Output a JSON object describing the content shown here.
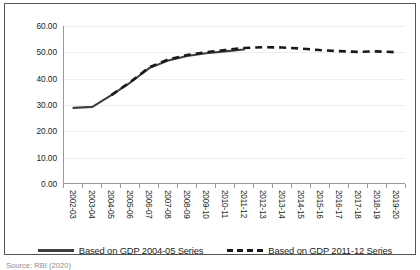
{
  "chart_data": {
    "type": "line",
    "title": "",
    "xlabel": "",
    "ylabel": "",
    "ylim": [
      0,
      60
    ],
    "ytick_step": 10,
    "ytick_labels": [
      "0.00",
      "10.00",
      "20.00",
      "30.00",
      "40.00",
      "50.00",
      "60.00"
    ],
    "ytick_values": [
      0,
      10,
      20,
      30,
      40,
      50,
      60
    ],
    "grid": true,
    "grid_axis": "y",
    "legend_position": "bottom",
    "categories": [
      "2002-03",
      "2003-04",
      "2004-05",
      "2005-06",
      "2006-07",
      "2007-08",
      "2008-09",
      "2009-10",
      "2010-11",
      "2011-12",
      "2012-13",
      "2013-14",
      "2014-15",
      "2015-16",
      "2016-17",
      "2017-18",
      "2018-19",
      "2019-20"
    ],
    "series": [
      {
        "name": "Based on GDP 2004-05 Series",
        "style": "solid",
        "color": "#3f3f3f",
        "values": [
          28.7,
          29.1,
          33.6,
          38.4,
          43.9,
          46.8,
          48.5,
          49.6,
          50.3,
          51.0,
          null,
          null,
          null,
          null,
          null,
          null,
          null,
          null
        ]
      },
      {
        "name": "Based on GDP 2011-12 Series",
        "style": "dashed",
        "color": "#1a1a1a",
        "values": [
          null,
          null,
          33.6,
          38.6,
          44.2,
          47.2,
          48.9,
          50.0,
          50.8,
          51.6,
          51.9,
          51.8,
          51.4,
          50.8,
          50.4,
          50.1,
          50.3,
          50.0
        ]
      }
    ]
  },
  "legend": {
    "items": [
      {
        "label": "Based on GDP 2004-05 Series",
        "style": "solid"
      },
      {
        "label": "Based on GDP 2011-12 Series",
        "style": "dashed"
      }
    ]
  },
  "source": {
    "text": "Source: RBI (2020)"
  }
}
